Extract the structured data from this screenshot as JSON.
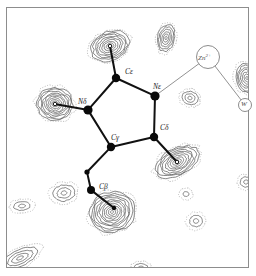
{
  "figure": {
    "type": "crystallographic-electron-density-map",
    "background_color": "#ffffff",
    "frame_color": "#8d8d8d",
    "contour_solid_color": "#3a3a3a",
    "contour_dotted_color": "#9a9a9a",
    "bond_color": "#111111",
    "atom_color": "#0a0a0a",
    "thin_bond_color": "#6e6e6e"
  },
  "labels": {
    "c_epsilon": "Cε",
    "n_epsilon": "Nε",
    "n_delta": "Nδ",
    "c_gamma": "Cγ",
    "c_delta": "Cδ",
    "c_beta": "Cβ",
    "zinc": "Zn",
    "zinc_charge": "2+",
    "water": "W"
  },
  "chart_data": {
    "type": "heatmap",
    "title": "",
    "xlabel": "",
    "ylabel": "",
    "grid": false,
    "legend": "none",
    "contour_style": {
      "positive": "solid",
      "negative": "dotted",
      "levels_visible_max": 12
    },
    "atoms": [
      {
        "name": "Cε",
        "x": 116,
        "y": 78,
        "radius": 4.2,
        "filled": true,
        "label_dx": 9,
        "label_dy": -10
      },
      {
        "name": "Nε",
        "x": 155,
        "y": 96,
        "radius": 4.6,
        "filled": true,
        "label_dx": -2,
        "label_dy": -13
      },
      {
        "name": "Nδ",
        "x": 88,
        "y": 110,
        "radius": 4.6,
        "filled": true,
        "label_dx": -10,
        "label_dy": -12
      },
      {
        "name": "Cγ",
        "x": 111,
        "y": 147,
        "radius": 4.2,
        "filled": true,
        "label_dx": 0,
        "label_dy": -13
      },
      {
        "name": "Cδ",
        "x": 154,
        "y": 137,
        "radius": 4.2,
        "filled": true,
        "label_dx": 6,
        "label_dy": -13
      },
      {
        "name": "Cβ",
        "x": 91,
        "y": 190,
        "radius": 4.0,
        "filled": true,
        "label_dx": 8,
        "label_dy": -7
      },
      {
        "name": "Cβ-branch",
        "x": 87,
        "y": 172,
        "radius": 2.6,
        "filled": true,
        "label_dx": 0,
        "label_dy": 0
      },
      {
        "name": "peak-top",
        "x": 110,
        "y": 46,
        "radius": 1.8,
        "filled": false,
        "label_dx": 0,
        "label_dy": 0
      },
      {
        "name": "peak-left",
        "x": 55,
        "y": 104,
        "radius": 1.8,
        "filled": false,
        "label_dx": 0,
        "label_dy": 0
      },
      {
        "name": "peak-right",
        "x": 177,
        "y": 162,
        "radius": 1.8,
        "filled": false,
        "label_dx": 0,
        "label_dy": 0
      },
      {
        "name": "peak-bottom",
        "x": 114,
        "y": 208,
        "radius": 2.2,
        "filled": true,
        "label_dx": 0,
        "label_dy": 0
      }
    ],
    "bonds": [
      {
        "from": "Cε",
        "to": "Nε",
        "weight": "thick"
      },
      {
        "from": "Nε",
        "to": "Cδ",
        "weight": "thick"
      },
      {
        "from": "Cδ",
        "to": "Cγ",
        "weight": "thick"
      },
      {
        "from": "Cγ",
        "to": "Nδ",
        "weight": "thick"
      },
      {
        "from": "Nδ",
        "to": "Cε",
        "weight": "thick"
      },
      {
        "from": "Cε",
        "to": "peak-top",
        "weight": "thick"
      },
      {
        "from": "Nδ",
        "to": "peak-left",
        "weight": "thick"
      },
      {
        "from": "Cδ",
        "to": "peak-right",
        "weight": "thick"
      },
      {
        "from": "Cγ",
        "to": "Cβ-branch",
        "weight": "thick"
      },
      {
        "from": "Cβ-branch",
        "to": "Cβ",
        "weight": "thick"
      },
      {
        "from": "Cβ",
        "to": "peak-bottom",
        "weight": "thick"
      },
      {
        "from": "Nε",
        "to": "Zn",
        "weight": "thin"
      },
      {
        "from": "Zn",
        "to": "W",
        "weight": "thin"
      }
    ],
    "ions": [
      {
        "name": "Zn",
        "x": 208,
        "y": 57,
        "radius": 11.5,
        "open_circle": true
      },
      {
        "name": "W",
        "x": 245,
        "y": 105,
        "radius": 6.5,
        "open_circle": true
      }
    ],
    "density_peaks": [
      {
        "id": "peak-top",
        "cx": 110,
        "cy": 46,
        "rings": 9,
        "rx": 22,
        "ry": 16,
        "rot": -22,
        "sign": "positive"
      },
      {
        "id": "peak-left",
        "cx": 55,
        "cy": 104,
        "rings": 10,
        "rx": 20,
        "ry": 18,
        "rot": 8,
        "sign": "positive"
      },
      {
        "id": "peak-right",
        "cx": 177,
        "cy": 162,
        "rings": 9,
        "rx": 26,
        "ry": 15,
        "rot": -28,
        "sign": "positive"
      },
      {
        "id": "peak-bottom",
        "cx": 112,
        "cy": 212,
        "rings": 11,
        "rx": 25,
        "ry": 22,
        "rot": -15,
        "sign": "positive"
      },
      {
        "id": "peak-topright",
        "cx": 166,
        "cy": 38,
        "rings": 6,
        "rx": 10,
        "ry": 16,
        "rot": 12,
        "sign": "positive"
      },
      {
        "id": "peak-rightedge",
        "cx": 247,
        "cy": 78,
        "rings": 7,
        "rx": 13,
        "ry": 17,
        "rot": -10,
        "sign": "positive"
      },
      {
        "id": "peak-midright",
        "cx": 190,
        "cy": 98,
        "rings": 3,
        "rx": 11,
        "ry": 9,
        "rot": 15,
        "sign": "positive"
      },
      {
        "id": "peak-bottomleft",
        "cx": 64,
        "cy": 193,
        "rings": 3,
        "rx": 15,
        "ry": 11,
        "rot": -10,
        "sign": "positive"
      },
      {
        "id": "peak-farleft",
        "cx": 22,
        "cy": 206,
        "rings": 2,
        "rx": 13,
        "ry": 7,
        "rot": -5,
        "sign": "positive"
      },
      {
        "id": "peak-lowerright",
        "cx": 196,
        "cy": 221,
        "rings": 2,
        "rx": 10,
        "ry": 9,
        "rot": 0,
        "sign": "positive"
      },
      {
        "id": "peak-lowerleft",
        "cx": 20,
        "cy": 258,
        "rings": 4,
        "rx": 24,
        "ry": 10,
        "rot": -25,
        "sign": "positive"
      },
      {
        "id": "peak-bottomedge",
        "cx": 141,
        "cy": 268,
        "rings": 2,
        "rx": 11,
        "ry": 7,
        "rot": 0,
        "sign": "positive"
      },
      {
        "id": "peak-rightlow",
        "cx": 246,
        "cy": 182,
        "rings": 2,
        "rx": 9,
        "ry": 8,
        "rot": 0,
        "sign": "positive"
      },
      {
        "id": "peak-midbottom",
        "cx": 186,
        "cy": 194,
        "rings": 1,
        "rx": 7,
        "ry": 6,
        "rot": 0,
        "sign": "positive"
      }
    ],
    "axis_ranges": {
      "x": [
        0,
        256
      ],
      "y": [
        0,
        276
      ]
    }
  }
}
